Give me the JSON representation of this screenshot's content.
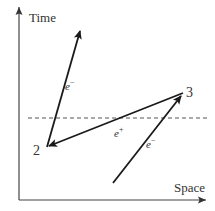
{
  "diagram": {
    "type": "spacetime-diagram",
    "axes": {
      "vertical_label": "Time",
      "horizontal_label": "Space"
    },
    "points": [
      {
        "id": "2",
        "label": "2"
      },
      {
        "id": "3",
        "label": "3"
      }
    ],
    "worldlines": [
      {
        "id": "electron-out",
        "from": "2",
        "to": "future",
        "particle": "e",
        "charge_sign": "−"
      },
      {
        "id": "positron",
        "from": "3",
        "to": "2",
        "particle": "e",
        "charge_sign": "+"
      },
      {
        "id": "electron-in",
        "from": "past",
        "to": "3",
        "particle": "e",
        "charge_sign": "−"
      }
    ],
    "reference_line": {
      "style": "dashed",
      "meaning": "instant of time"
    },
    "colors": {
      "line": "#1a1a1a",
      "dashed": "#555555",
      "text": "#333333",
      "background": "#ffffff"
    }
  }
}
